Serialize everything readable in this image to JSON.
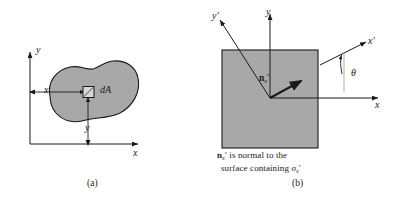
{
  "figure": {
    "type": "engineering-mechanics-diagram",
    "width": 396,
    "height": 197,
    "background_color": "#ffffff",
    "stroke_color": "#1a1a1a",
    "fill_gray": "#a8a8a8"
  },
  "panel_a": {
    "caption": "(a)",
    "axes": {
      "y_label": "y",
      "x_label": "x"
    },
    "dimension_labels": {
      "horizontal": "x",
      "vertical": "y"
    },
    "element_label": "dA",
    "shape": "irregular-blob-cross-section"
  },
  "panel_b": {
    "caption": "(b)",
    "axes": {
      "y_label": "y",
      "x_label": "x",
      "y_prime_label": "y'",
      "x_prime_label": "x'"
    },
    "angle_label": "θ",
    "normal_vector": {
      "symbol": "n",
      "prime": "′",
      "subscript": "x"
    },
    "note": {
      "line1_prefix": "",
      "line1_text": " is normal to the",
      "line2_text": "surface containing ",
      "sigma_symbol": "σ",
      "sigma_prime": "′",
      "sigma_subscript": "x",
      "full_text": "n'x is normal to the surface containing σ'x"
    },
    "shape": "square-element"
  }
}
